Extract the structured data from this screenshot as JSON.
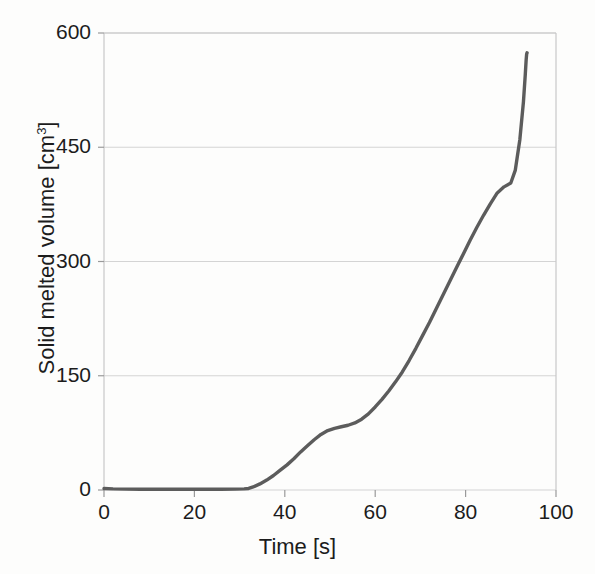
{
  "chart_data": {
    "type": "line",
    "title": "",
    "xlabel": "Time [s]",
    "ylabel_text": "Solid melted volume [cm",
    "ylabel_sup": "3",
    "ylabel_tail": "]",
    "ylabel_full": "Solid melted volume [cm3]",
    "xlim": [
      0,
      100
    ],
    "ylim": [
      0,
      600
    ],
    "xticks": [
      0,
      20,
      40,
      60,
      80,
      100
    ],
    "xtick_labels": [
      "0",
      "20",
      "40",
      "60",
      "80",
      "100"
    ],
    "yticks": [
      0,
      150,
      300,
      450,
      600
    ],
    "ytick_labels": [
      "0",
      "150",
      "300",
      "450",
      "600"
    ],
    "grid": "horizontal",
    "legend": "none",
    "series": [
      {
        "name": "Solid melted volume",
        "color": "#5c5c5c",
        "line_width": 3.4,
        "x": [
          0,
          2,
          5,
          8,
          11,
          14,
          17,
          20,
          23,
          26,
          29,
          31,
          32,
          33,
          34.5,
          36,
          37.5,
          39,
          40.5,
          42,
          43.5,
          45,
          46.5,
          48,
          49.5,
          51,
          52.5,
          54,
          55.5,
          57,
          58.5,
          60,
          61.5,
          63,
          64.5,
          66,
          67.5,
          69,
          70.5,
          72,
          73.5,
          75,
          76.5,
          78,
          79.5,
          81,
          82.5,
          84,
          85.5,
          87,
          88.5,
          90,
          91,
          92,
          92.8,
          93.2,
          93.4,
          93.5,
          93.6
        ],
        "y": [
          2,
          1.5,
          1.2,
          1.0,
          1.0,
          1.0,
          1.0,
          1.0,
          1.0,
          1.0,
          1.2,
          1.5,
          2,
          4,
          8,
          13,
          19,
          26,
          33,
          41,
          50,
          58,
          66,
          73,
          78,
          81,
          83,
          85,
          88,
          93,
          100,
          109,
          119,
          130,
          142,
          155,
          170,
          186,
          203,
          220,
          238,
          256,
          274,
          292,
          310,
          328,
          345,
          361,
          376,
          390,
          398,
          403,
          420,
          460,
          510,
          545,
          565,
          572,
          574
        ]
      }
    ]
  },
  "axes": {
    "plot_left_px": 104,
    "plot_right_px": 556,
    "plot_top_px": 33,
    "plot_bottom_px": 490,
    "grid_color": "#d4d4d4",
    "axis_color": "#c8c8c8"
  }
}
